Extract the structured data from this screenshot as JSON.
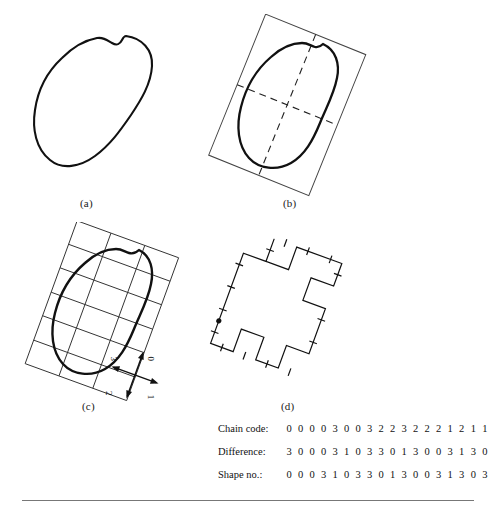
{
  "figure": {
    "panels": [
      {
        "id": "a",
        "label": "(a)",
        "caption_text": "(a)",
        "content": "smooth-closed-boundary-curve"
      },
      {
        "id": "b",
        "label": "(b)",
        "caption_text": "(b)",
        "content": "boundary-with-rotated-bounding-box-and-major-minor-axes"
      },
      {
        "id": "c",
        "label": "(c)",
        "caption_text": "(c)",
        "content": "boundary-resampled-on-rotated-grid-with-direction-key"
      },
      {
        "id": "d",
        "label": "(d)",
        "caption_text": "(d)",
        "content": "chain-coded-polygon-with-tick-marks-and-start-point"
      }
    ],
    "direction_key": {
      "name": "chain-code-direction-axes",
      "labels": [
        "0",
        "1",
        "2",
        "3"
      ]
    }
  },
  "code_table": {
    "rows": [
      {
        "name": "chain-code",
        "label": "Chain code:",
        "digits": [
          "0",
          "0",
          "0",
          "0",
          "3",
          "0",
          "0",
          "3",
          "2",
          "2",
          "3",
          "2",
          "2",
          "2",
          "1",
          "2",
          "1",
          "1"
        ]
      },
      {
        "name": "difference",
        "label": "Difference:",
        "digits": [
          "3",
          "0",
          "0",
          "0",
          "3",
          "1",
          "0",
          "3",
          "3",
          "0",
          "1",
          "3",
          "0",
          "0",
          "3",
          "1",
          "3",
          "0"
        ]
      },
      {
        "name": "shape-number",
        "label": "Shape no.:",
        "digits": [
          "0",
          "0",
          "0",
          "3",
          "1",
          "0",
          "3",
          "3",
          "0",
          "1",
          "3",
          "0",
          "0",
          "3",
          "1",
          "3",
          "0",
          "3"
        ]
      }
    ]
  },
  "colors": {
    "ink": "#111111",
    "rule": "#777777",
    "background": "#ffffff"
  }
}
